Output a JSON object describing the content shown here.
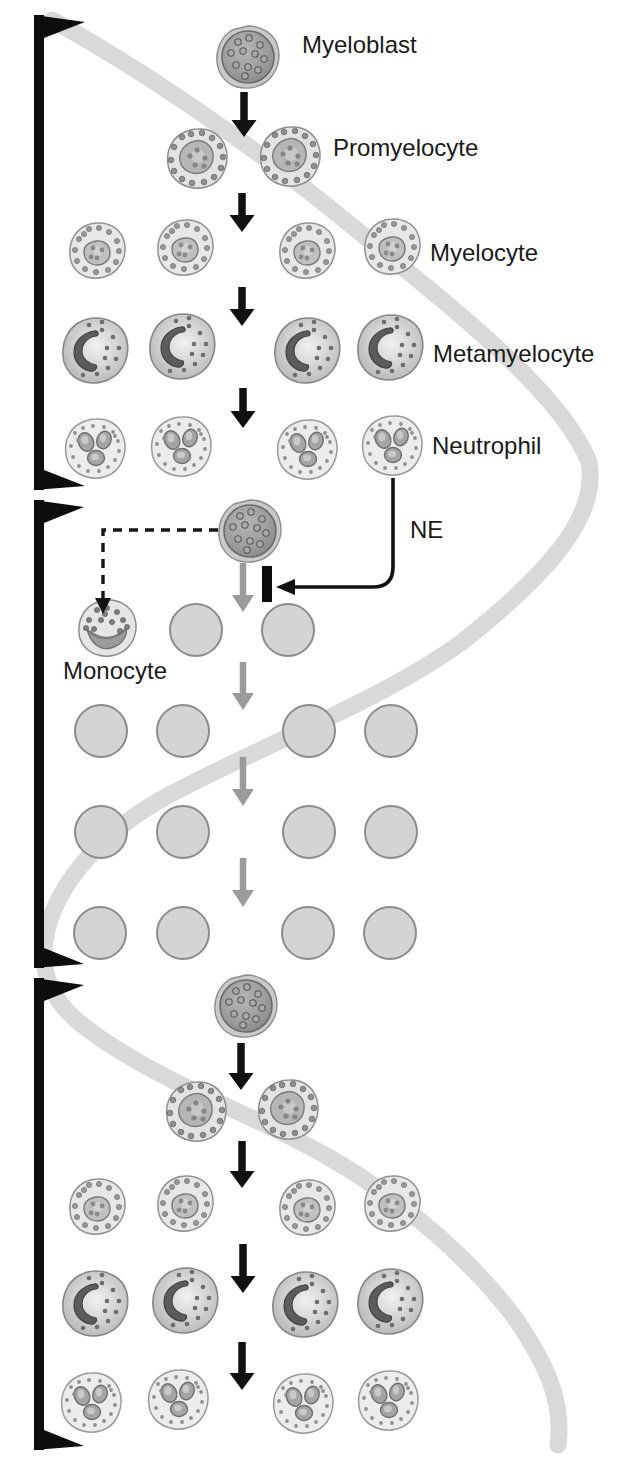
{
  "figure": {
    "type": "diagram",
    "labels": {
      "myeloblast": {
        "text": "Myeloblast",
        "x": 302,
        "y": 47
      },
      "promyelocyte": {
        "text": "Promyelocyte",
        "x": 333,
        "y": 150
      },
      "myelocyte": {
        "text": "Myelocyte",
        "x": 430,
        "y": 255
      },
      "metamyelocyte": {
        "text": "Metamyelocyte",
        "x": 433,
        "y": 356
      },
      "neutrophil": {
        "text": "Neutrophil",
        "x": 432,
        "y": 448
      },
      "ne": {
        "text": "NE",
        "x": 410,
        "y": 532
      },
      "monocyte": {
        "text": "Monocyte",
        "x": 63,
        "y": 673
      }
    },
    "colors": {
      "background": "#ffffff",
      "cycle_band": "#d9d9d9",
      "bracket_black": "#0d0d0d",
      "arrow_black": "#111111",
      "arrow_gray": "#9b9b9b",
      "empty_cell_fill": "#d4d4d4",
      "empty_cell_border": "#8b8b8b",
      "label_text": "#1a1a1a"
    },
    "cells": [
      {
        "type": "myeloblast",
        "x": 248,
        "y": 57
      },
      {
        "type": "promyelocyte",
        "x": 197,
        "y": 158
      },
      {
        "type": "promyelocyte",
        "x": 290,
        "y": 156
      },
      {
        "type": "myelocyte",
        "x": 97,
        "y": 250
      },
      {
        "type": "myelocyte",
        "x": 185,
        "y": 247
      },
      {
        "type": "myelocyte",
        "x": 307,
        "y": 250
      },
      {
        "type": "myelocyte",
        "x": 392,
        "y": 246
      },
      {
        "type": "metamyelocyte",
        "x": 95,
        "y": 350
      },
      {
        "type": "metamyelocyte",
        "x": 182,
        "y": 346
      },
      {
        "type": "metamyelocyte",
        "x": 307,
        "y": 350
      },
      {
        "type": "metamyelocyte",
        "x": 390,
        "y": 347
      },
      {
        "type": "neutrophil",
        "x": 95,
        "y": 448
      },
      {
        "type": "neutrophil",
        "x": 181,
        "y": 446
      },
      {
        "type": "neutrophil",
        "x": 307,
        "y": 449
      },
      {
        "type": "neutrophil",
        "x": 392,
        "y": 445
      },
      {
        "type": "myeloblast",
        "x": 250,
        "y": 531
      },
      {
        "type": "monocyte",
        "x": 107,
        "y": 628
      },
      {
        "type": "empty",
        "x": 196,
        "y": 630
      },
      {
        "type": "empty",
        "x": 288,
        "y": 630
      },
      {
        "type": "empty",
        "x": 101,
        "y": 731
      },
      {
        "type": "empty",
        "x": 183,
        "y": 731
      },
      {
        "type": "empty",
        "x": 309,
        "y": 731
      },
      {
        "type": "empty",
        "x": 391,
        "y": 731
      },
      {
        "type": "empty",
        "x": 101,
        "y": 832
      },
      {
        "type": "empty",
        "x": 183,
        "y": 832
      },
      {
        "type": "empty",
        "x": 309,
        "y": 832
      },
      {
        "type": "empty",
        "x": 391,
        "y": 832
      },
      {
        "type": "empty",
        "x": 100,
        "y": 933
      },
      {
        "type": "empty",
        "x": 183,
        "y": 933
      },
      {
        "type": "empty",
        "x": 308,
        "y": 933
      },
      {
        "type": "empty",
        "x": 390,
        "y": 933
      },
      {
        "type": "myeloblast",
        "x": 246,
        "y": 1006
      },
      {
        "type": "promyelocyte",
        "x": 196,
        "y": 1111
      },
      {
        "type": "promyelocyte",
        "x": 288,
        "y": 1109
      },
      {
        "type": "myelocyte",
        "x": 97,
        "y": 1206
      },
      {
        "type": "myelocyte",
        "x": 185,
        "y": 1203
      },
      {
        "type": "myelocyte",
        "x": 307,
        "y": 1207
      },
      {
        "type": "myelocyte",
        "x": 392,
        "y": 1203
      },
      {
        "type": "metamyelocyte",
        "x": 95,
        "y": 1303
      },
      {
        "type": "metamyelocyte",
        "x": 185,
        "y": 1300
      },
      {
        "type": "metamyelocyte",
        "x": 305,
        "y": 1304
      },
      {
        "type": "metamyelocyte",
        "x": 390,
        "y": 1301
      },
      {
        "type": "neutrophil",
        "x": 91,
        "y": 1402
      },
      {
        "type": "neutrophil",
        "x": 178,
        "y": 1399
      },
      {
        "type": "neutrophil",
        "x": 303,
        "y": 1403
      },
      {
        "type": "neutrophil",
        "x": 388,
        "y": 1400
      }
    ],
    "arrows": [
      {
        "style": "black",
        "x": 244,
        "y1": 92,
        "y2": 137
      },
      {
        "style": "black",
        "x": 242,
        "y1": 193,
        "y2": 232
      },
      {
        "style": "black",
        "x": 242,
        "y1": 287,
        "y2": 326
      },
      {
        "style": "black",
        "x": 243,
        "y1": 388,
        "y2": 428
      },
      {
        "style": "gray",
        "x": 243,
        "y1": 563,
        "y2": 612
      },
      {
        "style": "gray",
        "x": 243,
        "y1": 662,
        "y2": 710
      },
      {
        "style": "gray",
        "x": 243,
        "y1": 757,
        "y2": 806
      },
      {
        "style": "gray",
        "x": 243,
        "y1": 858,
        "y2": 907
      },
      {
        "style": "black",
        "x": 241,
        "y1": 1043,
        "y2": 1090
      },
      {
        "style": "black",
        "x": 242,
        "y1": 1141,
        "y2": 1188
      },
      {
        "style": "black",
        "x": 243,
        "y1": 1244,
        "y2": 1293
      },
      {
        "style": "black",
        "x": 242,
        "y1": 1342,
        "y2": 1390
      }
    ],
    "brackets": [
      {
        "name": "cycle-1",
        "y_top": 15,
        "y_bottom": 490
      },
      {
        "name": "cycle-2",
        "y_top": 500,
        "y_bottom": 968
      },
      {
        "name": "cycle-3",
        "y_top": 978,
        "y_bottom": 1450
      }
    ]
  }
}
